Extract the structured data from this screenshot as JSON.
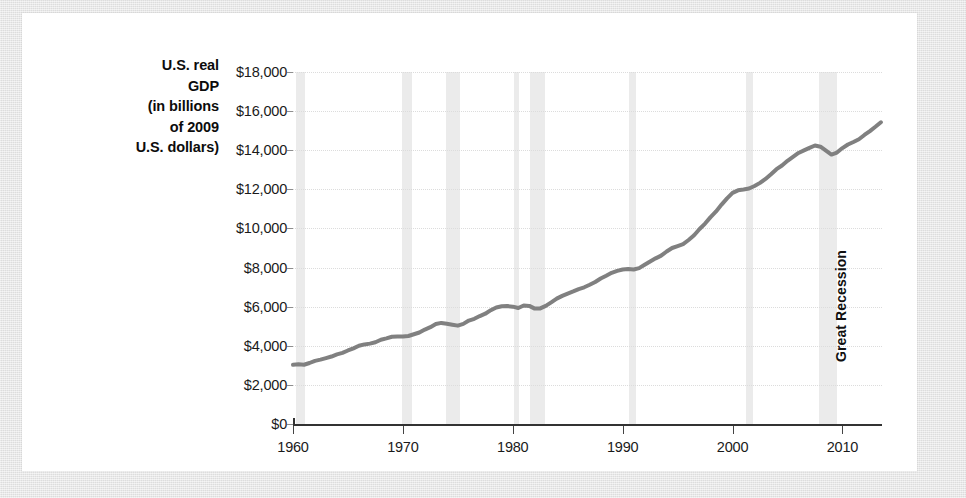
{
  "figure": {
    "background_color": "#e4e4e4",
    "card_color": "#ffffff",
    "line_color": "#808080",
    "band_color": "#ebebeb",
    "grid_color": "#dcdcdc"
  },
  "chart_data": {
    "type": "line",
    "title": "",
    "xlabel": "",
    "ylabel": "U.S. real GDP (in billions of 2009 U.S. dollars)",
    "ylabel_lines": [
      "U.S. real",
      "GDP",
      "(in billions",
      "of 2009",
      "U.S. dollars)"
    ],
    "xlim": [
      1960,
      2013.6
    ],
    "ylim": [
      0,
      18000
    ],
    "grid": true,
    "legend": null,
    "ytick_labels": [
      "$18,000",
      "$16,000",
      "$14,000",
      "$12,000",
      "$10,000",
      "$8,000",
      "$6,000",
      "$4,000",
      "$2,000",
      "$0"
    ],
    "ytick_values": [
      18000,
      16000,
      14000,
      12000,
      10000,
      8000,
      6000,
      4000,
      2000,
      0
    ],
    "xtick_labels": [
      "1960",
      "1970",
      "1980",
      "1990",
      "2000",
      "2010"
    ],
    "xtick_values": [
      1960,
      1970,
      1980,
      1990,
      2000,
      2010
    ],
    "annotations": [
      {
        "text": "Great Recession",
        "x": 2008.5,
        "rotation": -90
      }
    ],
    "shaded_bands": [
      {
        "label": "1960-61 recession",
        "x0": 1960.3,
        "x1": 1961.1
      },
      {
        "label": "1969-70 recession",
        "x0": 1969.9,
        "x1": 1970.8
      },
      {
        "label": "1973-75 recession",
        "x0": 1973.9,
        "x1": 1975.2
      },
      {
        "label": "1980 recession",
        "x0": 1980.1,
        "x1": 1980.6
      },
      {
        "label": "1981-82 recession",
        "x0": 1981.6,
        "x1": 1982.9
      },
      {
        "label": "1990-91 recession",
        "x0": 1990.6,
        "x1": 1991.2
      },
      {
        "label": "2001 recession",
        "x0": 2001.2,
        "x1": 2001.9
      },
      {
        "label": "Great Recession",
        "x0": 2007.9,
        "x1": 2009.5
      }
    ],
    "series": [
      {
        "name": "U.S. real GDP",
        "x": [
          1960.0,
          1960.5,
          1961.0,
          1961.5,
          1962.0,
          1962.5,
          1963.0,
          1963.5,
          1964.0,
          1964.5,
          1965.0,
          1965.5,
          1966.0,
          1966.5,
          1967.0,
          1967.5,
          1968.0,
          1968.5,
          1969.0,
          1969.5,
          1970.0,
          1970.5,
          1971.0,
          1971.5,
          1972.0,
          1972.5,
          1973.0,
          1973.5,
          1974.0,
          1974.5,
          1975.0,
          1975.5,
          1976.0,
          1976.5,
          1977.0,
          1977.5,
          1978.0,
          1978.5,
          1979.0,
          1979.5,
          1980.0,
          1980.5,
          1981.0,
          1981.5,
          1982.0,
          1982.5,
          1983.0,
          1983.5,
          1984.0,
          1984.5,
          1985.0,
          1985.5,
          1986.0,
          1986.5,
          1987.0,
          1987.5,
          1988.0,
          1988.5,
          1989.0,
          1989.5,
          1990.0,
          1990.5,
          1991.0,
          1991.5,
          1992.0,
          1992.5,
          1993.0,
          1993.5,
          1994.0,
          1994.5,
          1995.0,
          1995.5,
          1996.0,
          1996.5,
          1997.0,
          1997.5,
          1998.0,
          1998.5,
          1999.0,
          1999.5,
          2000.0,
          2000.5,
          2001.0,
          2001.5,
          2002.0,
          2002.5,
          2003.0,
          2003.5,
          2004.0,
          2004.5,
          2005.0,
          2005.5,
          2006.0,
          2006.5,
          2007.0,
          2007.5,
          2008.0,
          2008.5,
          2009.0,
          2009.5,
          2010.0,
          2010.5,
          2011.0,
          2011.5,
          2012.0,
          2012.5,
          2013.0,
          2013.5
        ],
        "y": [
          3030,
          3050,
          3030,
          3120,
          3230,
          3290,
          3370,
          3450,
          3560,
          3640,
          3760,
          3870,
          4000,
          4070,
          4110,
          4180,
          4310,
          4380,
          4460,
          4480,
          4470,
          4500,
          4590,
          4680,
          4830,
          4950,
          5110,
          5170,
          5130,
          5080,
          5030,
          5120,
          5290,
          5380,
          5520,
          5640,
          5820,
          5960,
          6020,
          6030,
          6000,
          5930,
          6060,
          6040,
          5900,
          5910,
          6040,
          6220,
          6410,
          6550,
          6670,
          6780,
          6900,
          6990,
          7120,
          7260,
          7440,
          7580,
          7730,
          7830,
          7900,
          7930,
          7900,
          7970,
          8140,
          8310,
          8470,
          8610,
          8820,
          9000,
          9100,
          9200,
          9410,
          9650,
          9970,
          10250,
          10580,
          10870,
          11220,
          11540,
          11820,
          11950,
          11990,
          12040,
          12170,
          12330,
          12530,
          12770,
          13030,
          13220,
          13460,
          13660,
          13860,
          13990,
          14120,
          14240,
          14180,
          13980,
          13780,
          13880,
          14110,
          14290,
          14420,
          14560,
          14780,
          14980,
          15200,
          15430
        ]
      }
    ]
  }
}
